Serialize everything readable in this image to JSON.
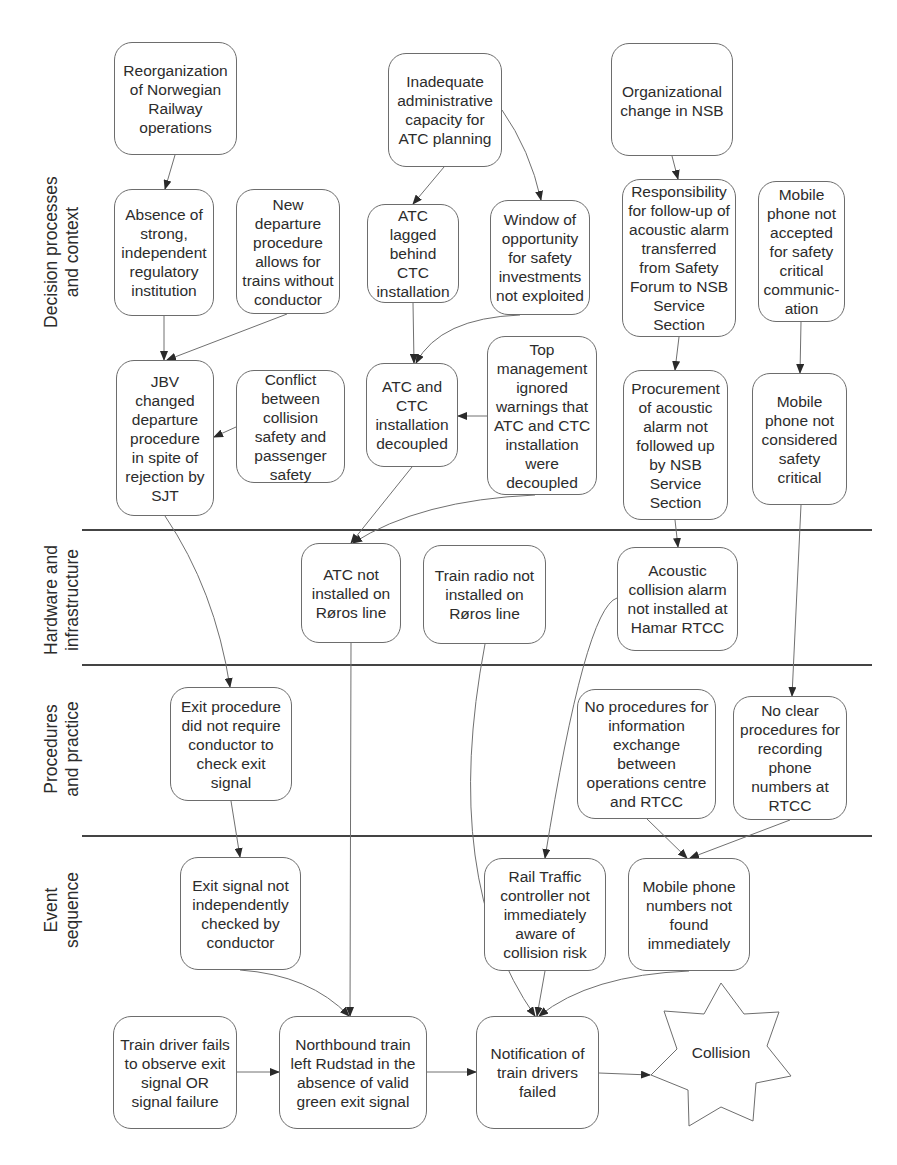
{
  "lanes": [
    {
      "id": "decision",
      "label": "Decision processes\nand context"
    },
    {
      "id": "hardware",
      "label": "Hardware and\ninfrastructure"
    },
    {
      "id": "procedures",
      "label": "Procedures\nand practice"
    },
    {
      "id": "events",
      "label": "Event\nsequence"
    }
  ],
  "nodes": {
    "reorganization": "Reorganization\nof Norwegian\nRailway\noperations",
    "inadequate_capacity": "Inadequate\nadministrative\ncapacity for\nATC planning",
    "organizational_change": "Organizational\nchange in NSB",
    "absence_regulator": "Absence of\nstrong,\nindependent\nregulatory\ninstitution",
    "new_departure": "New\ndeparture\nprocedure\nallows for\ntrains without\nconductor",
    "atc_lagged": "ATC\nlagged\nbehind\nCTC\ninstallation",
    "window_opportunity": "Window of\nopportunity\nfor safety\ninvestments\nnot exploited",
    "responsibility": "Responsibility\nfor follow-up of\nacoustic alarm\ntransferred\nfrom Safety\nForum to NSB\nService\nSection",
    "mobile_not_accepted": "Mobile\nphone not\naccepted\nfor safety\ncritical\ncommunic-\nation",
    "jbv_changed": "JBV\nchanged\ndeparture\nprocedure\nin spite of\nrejection by\nSJT",
    "conflict": "Conflict\nbetween\ncollision\nsafety and\npassenger\nsafety",
    "atc_ctc_decoupled": "ATC and\nCTC\ninstallation\ndecoupled",
    "top_management": "Top\nmanagement\nignored\nwarnings that\nATC and CTC\ninstallation\nwere\ndecoupled",
    "procurement": "Procurement\nof acoustic\nalarm not\nfollowed up\nby NSB\nService\nSection",
    "mobile_not_considered": "Mobile\nphone not\nconsidered\nsafety\ncritical",
    "atc_not_installed": "ATC not\ninstalled on\nRøros line",
    "train_radio": "Train radio not\ninstalled on\nRøros line",
    "acoustic_alarm": "Acoustic\ncollision alarm\nnot installed at\nHamar RTCC",
    "exit_procedure": "Exit procedure\ndid not require\nconductor to\ncheck exit\nsignal",
    "no_procedures_info": "No procedures for\ninformation\nexchange\nbetween\noperations centre\nand RTCC",
    "no_clear_procedures": "No clear\nprocedures for\nrecording\nphone\nnumbers at\nRTCC",
    "exit_signal_not_checked": "Exit signal not\nindependently\nchecked by\nconductor",
    "rail_traffic_controller": "Rail Traffic\ncontroller not\nimmediately\naware of\ncollision risk",
    "mobile_numbers": "Mobile phone\nnumbers not\nfound\nimmediately",
    "train_driver_fails": "Train driver fails\nto observe exit\nsignal OR\nsignal failure",
    "northbound_train": "Northbound train\nleft Rudstad in the\nabsence of valid\ngreen exit signal",
    "notification_failed": "Notification of\ntrain drivers\nfailed",
    "collision": "Collision"
  },
  "colors": {
    "stroke": "#6d6d6d",
    "separator": "#444444",
    "text": "#2c2c2c",
    "background": "#ffffff"
  }
}
